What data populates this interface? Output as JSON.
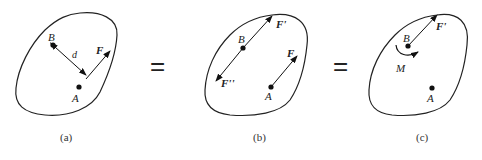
{
  "figure": {
    "panels": [
      {
        "id": "a",
        "caption": "(a)",
        "points": [
          {
            "label": "B"
          },
          {
            "label": "A"
          }
        ],
        "labels": {
          "point_b": "B",
          "point_a": "A",
          "force": "F",
          "distance": "d"
        }
      },
      {
        "id": "b",
        "caption": "(b)",
        "labels": {
          "point_b": "B",
          "point_a": "A",
          "force": "F",
          "force_prime": "F'",
          "force_double_prime": "F''"
        }
      },
      {
        "id": "c",
        "caption": "(c)",
        "labels": {
          "point_b": "B",
          "point_a": "A",
          "force_prime": "F'",
          "moment": "M"
        }
      }
    ],
    "equals_1": "=",
    "equals_2": "="
  }
}
